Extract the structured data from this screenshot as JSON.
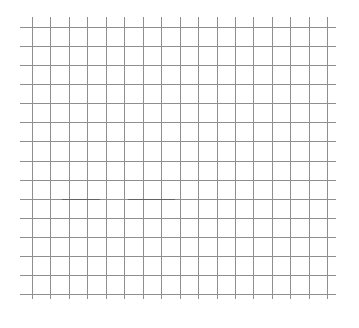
{
  "grid": {
    "vertical_lines_x": [
      32,
      50,
      69,
      87,
      106,
      124,
      143,
      161,
      180,
      198,
      217,
      235,
      253,
      272,
      290,
      309,
      327
    ],
    "vertical_extent": {
      "top": 17,
      "bottom": 299
    },
    "horizontal_lines_y": [
      27,
      46,
      65,
      84,
      103,
      122,
      141,
      161,
      180,
      199,
      218,
      237,
      256,
      275,
      294
    ],
    "horizontal_extent": {
      "left": 20,
      "right": 336
    },
    "line_color": "#8e8e8e",
    "background_color": "#ffffff"
  },
  "marks": [
    {
      "y": 199,
      "x1": 62,
      "x2": 100,
      "color": "#555555"
    },
    {
      "y": 199,
      "x1": 128,
      "x2": 175,
      "color": "#555555"
    }
  ]
}
